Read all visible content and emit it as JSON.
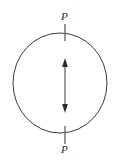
{
  "figure": {
    "type": "mechanics-diagram",
    "background_color": "#ffffff",
    "stroke_color": "#3a3a3a",
    "label_color": "#2b2b2b",
    "circle": {
      "name": "disk-outline",
      "center_x": 60,
      "center_y": 83,
      "radius_x": 47,
      "radius_y": 50,
      "stroke_width": 1
    },
    "load_top": {
      "label": "P",
      "tick_x": 65,
      "tick_y_start": 24,
      "tick_y_end": 41
    },
    "load_bottom": {
      "label": "P",
      "tick_x": 65,
      "tick_y_start": 126,
      "tick_y_end": 144
    },
    "diameter_arrow": {
      "name": "vertical-double-arrow",
      "x": 65,
      "y_top": 59,
      "y_bottom": 112,
      "head_style": "double",
      "stroke_width": 1
    }
  }
}
